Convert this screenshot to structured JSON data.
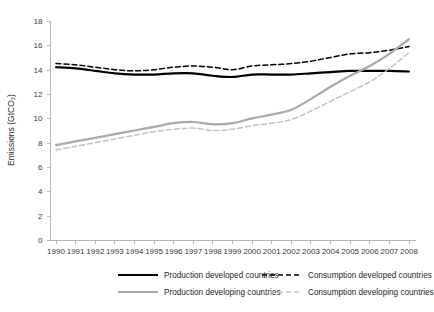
{
  "chart_data": {
    "type": "line",
    "title": "",
    "xlabel": "",
    "ylabel": "Emissions (GtCO₂)",
    "ylim": [
      0,
      18
    ],
    "ytick_step": 2,
    "yticks": [
      "0",
      "2",
      "4",
      "6",
      "8",
      "10",
      "12",
      "14",
      "16",
      "18"
    ],
    "grid": false,
    "legend_position": "bottom",
    "x": [
      1990,
      1991,
      1992,
      1993,
      1994,
      1995,
      1996,
      1997,
      1998,
      1999,
      2000,
      2001,
      2002,
      2003,
      2004,
      2005,
      2006,
      2007,
      2008
    ],
    "categories": [
      "1990",
      "1991",
      "1992",
      "1993",
      "1994",
      "1995",
      "1996",
      "1997",
      "1998",
      "1999",
      "2000",
      "2001",
      "2002",
      "2003",
      "2004",
      "2005",
      "2006",
      "2007",
      "2008"
    ],
    "series": [
      {
        "name": "Production developed countries",
        "key": "prod_developed",
        "color": "#000000",
        "style": "solid",
        "width": 2.2,
        "values": [
          14.2,
          14.1,
          13.9,
          13.7,
          13.6,
          13.6,
          13.7,
          13.7,
          13.5,
          13.4,
          13.6,
          13.6,
          13.6,
          13.7,
          13.8,
          13.9,
          13.9,
          13.9,
          13.85
        ]
      },
      {
        "name": "Consumption developed countries",
        "key": "cons_developed",
        "color": "#000000",
        "style": "dashed",
        "width": 1.5,
        "values": [
          14.5,
          14.4,
          14.2,
          14.0,
          13.9,
          14.0,
          14.2,
          14.3,
          14.2,
          14.0,
          14.3,
          14.4,
          14.5,
          14.7,
          15.0,
          15.3,
          15.4,
          15.6,
          15.9
        ]
      },
      {
        "name": "Production developing countries",
        "key": "prod_developing",
        "color": "#a9a9a9",
        "style": "solid",
        "width": 2.2,
        "values": [
          7.8,
          8.1,
          8.4,
          8.7,
          9.0,
          9.3,
          9.6,
          9.7,
          9.5,
          9.6,
          10.0,
          10.3,
          10.7,
          11.6,
          12.6,
          13.5,
          14.3,
          15.3,
          16.5
        ]
      },
      {
        "name": "Consumption developing countries",
        "key": "cons_developing",
        "color": "#c2c2c2",
        "style": "dashed",
        "width": 1.5,
        "values": [
          7.4,
          7.7,
          8.0,
          8.3,
          8.6,
          8.9,
          9.1,
          9.2,
          9.0,
          9.1,
          9.4,
          9.6,
          9.9,
          10.6,
          11.4,
          12.2,
          13.0,
          14.1,
          15.4
        ]
      }
    ],
    "legend": [
      {
        "label": "Production developed countries",
        "color": "#000000",
        "style": "solid"
      },
      {
        "label": "Consumption developed countries",
        "color": "#000000",
        "style": "dashed"
      },
      {
        "label": "Production developing countries",
        "color": "#a9a9a9",
        "style": "solid"
      },
      {
        "label": "Consumption developing countries",
        "color": "#c2c2c2",
        "style": "dashed"
      }
    ]
  }
}
